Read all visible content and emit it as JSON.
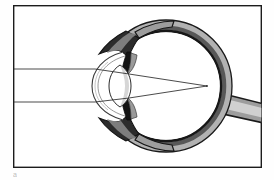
{
  "figure": {
    "caption_fragment": "a",
    "background_color": "#fefefe",
    "frame": {
      "name": "figure-border",
      "x": 13,
      "y": 5,
      "width": 249,
      "height": 163,
      "stroke_color": "#1c1c1c",
      "stroke_width": 1.4,
      "fill_color": "#ffffff"
    }
  },
  "palette": {
    "outline_black": "#111111",
    "sclera_gray": "#8d8d8d",
    "sclera_light_gray": "#b9b9b9",
    "choroid_dark": "#4a4a4a",
    "retina_line": "#1a1a1a",
    "iris_dark": "#1a1a1a",
    "lens_gray": "#a8a8a8",
    "vitreous_white": "#ffffff",
    "ray_line": "#2a2a2a",
    "optic_nerve_gray": "#9a9a9a"
  },
  "anatomy": {
    "eyeball": {
      "label": "eyeball",
      "center_x": 166,
      "center_y": 86,
      "radius_x": 62,
      "radius_y": 62
    },
    "layers": [
      {
        "name": "sclera",
        "label": "Sclera",
        "color": "#9b9b9b",
        "thickness": 7
      },
      {
        "name": "choroid",
        "label": "Choroid",
        "color": "#4f4f4f",
        "thickness": 4
      },
      {
        "name": "retina",
        "label": "Retina",
        "color": "#161616",
        "thickness": 2
      },
      {
        "name": "vitreous-humour",
        "label": "Vitreous humour",
        "color": "#ffffff",
        "thickness": 0
      }
    ],
    "cornea": {
      "label": "Cornea",
      "apex_x": 92,
      "top_y": 60,
      "bottom_y": 112,
      "color": "#2b2b2b"
    },
    "anterior_chamber": {
      "label": "Anterior chamber (aqueous humour)",
      "color": "#ffffff"
    },
    "iris": {
      "label": "Iris",
      "color": "#141414",
      "top_y": 52,
      "bottom_y": 120,
      "x": 117
    },
    "pupil": {
      "label": "Pupil",
      "top_y": 73,
      "bottom_y": 99
    },
    "lens": {
      "label": "Lens",
      "center_x": 120,
      "center_y": 86,
      "half_width": 9,
      "half_height": 21,
      "color": "#aaaaaa"
    },
    "ciliary_body": {
      "label": "Ciliary body",
      "color": "#6a6a6a"
    },
    "optic_nerve": {
      "label": "Optic nerve",
      "origin_x": 226,
      "origin_y": 100,
      "color": "#a0a0a0",
      "outline": "#1a1a1a"
    },
    "fovea": {
      "label": "Fovea",
      "x": 228,
      "y": 86
    }
  },
  "light_rays": {
    "label": "Parallel incident light rays",
    "entry_x": 13,
    "color": "#2a2a2a",
    "stroke_width": 0.85,
    "focal_point": {
      "x": 207,
      "y": 86
    },
    "rays": [
      {
        "name": "upper-ray",
        "label": "Upper parallel ray",
        "entry_y": 69,
        "cornea_hit_x": 96,
        "cornea_hit_y": 69,
        "lens_exit_x": 129,
        "lens_exit_y": 73
      },
      {
        "name": "lower-ray",
        "label": "Lower parallel ray",
        "entry_y": 102,
        "cornea_hit_x": 96,
        "cornea_hit_y": 102,
        "lens_exit_x": 129,
        "lens_exit_y": 99
      }
    ]
  }
}
